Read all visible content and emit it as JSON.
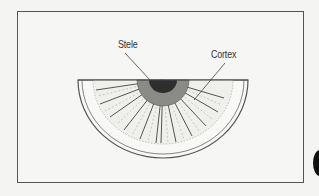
{
  "diagram": {
    "labels": {
      "stele": "Stele",
      "cortex": "Cortex"
    },
    "colors": {
      "line": "#444444",
      "stele": "#333333",
      "background": "#f6f6f4"
    }
  }
}
